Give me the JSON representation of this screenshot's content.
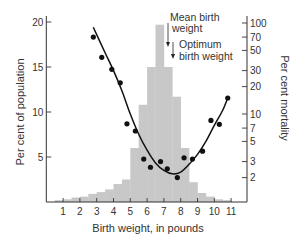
{
  "chart_data": {
    "type": "bar",
    "title": "",
    "xlabel": "Birth weight, in pounds",
    "ylabel": "Per cent of population",
    "ylabel_right": "Per cent mortality",
    "x_ticks": [
      1,
      2,
      3,
      4,
      5,
      6,
      7,
      8,
      9,
      10,
      11
    ],
    "y_ticks_left": [
      5,
      10,
      15,
      20
    ],
    "y_ticks_right": [
      2,
      3,
      5,
      7,
      10,
      20,
      30,
      50,
      70,
      100
    ],
    "ylim_left": [
      0,
      21
    ],
    "ylim_right_log": [
      1,
      100
    ],
    "histogram": {
      "name": "Per cent of population (birth weight distribution)",
      "bin_width_lb": 0.5,
      "bins": [
        {
          "from": 0.5,
          "to": 1.0,
          "value": 0.2
        },
        {
          "from": 1.0,
          "to": 1.5,
          "value": 0.3
        },
        {
          "from": 1.5,
          "to": 2.0,
          "value": 0.5
        },
        {
          "from": 2.0,
          "to": 2.5,
          "value": 0.6
        },
        {
          "from": 2.5,
          "to": 3.0,
          "value": 0.9
        },
        {
          "from": 3.0,
          "to": 3.5,
          "value": 1.1
        },
        {
          "from": 3.5,
          "to": 4.0,
          "value": 1.4
        },
        {
          "from": 4.0,
          "to": 4.5,
          "value": 2.0
        },
        {
          "from": 4.5,
          "to": 5.0,
          "value": 2.5
        },
        {
          "from": 5.0,
          "to": 5.5,
          "value": 6.0
        },
        {
          "from": 5.5,
          "to": 6.0,
          "value": 10.8
        },
        {
          "from": 6.0,
          "to": 6.5,
          "value": 15.0
        },
        {
          "from": 6.5,
          "to": 7.0,
          "value": 19.7
        },
        {
          "from": 7.0,
          "to": 7.5,
          "value": 15.0
        },
        {
          "from": 7.5,
          "to": 8.0,
          "value": 11.7
        },
        {
          "from": 8.0,
          "to": 8.5,
          "value": 6.0
        },
        {
          "from": 8.5,
          "to": 9.0,
          "value": 2.2
        },
        {
          "from": 9.0,
          "to": 9.5,
          "value": 1.0
        },
        {
          "from": 9.5,
          "to": 10.0,
          "value": 0.6
        },
        {
          "from": 10.0,
          "to": 10.5,
          "value": 0.3
        },
        {
          "from": 10.5,
          "to": 11.0,
          "value": 0.2
        }
      ],
      "color": "#c8c8c8"
    },
    "mortality_points": {
      "name": "Per cent mortality (observed)",
      "x": [
        2.8,
        3.3,
        3.9,
        4.4,
        4.8,
        5.3,
        5.8,
        6.2,
        6.8,
        7.2,
        7.8,
        8.2,
        8.7,
        9.3,
        9.8,
        10.3,
        10.8
      ],
      "y": [
        70,
        42,
        31,
        22,
        7.8,
        6.5,
        3.2,
        2.6,
        3.0,
        2.5,
        2.0,
        3.3,
        3.2,
        3.9,
        8.5,
        7.7,
        15
      ]
    },
    "mortality_curve": {
      "name": "Fitted mortality curve",
      "x": [
        2.8,
        3.5,
        4.0,
        4.5,
        5.0,
        5.5,
        6.0,
        6.5,
        7.0,
        7.5,
        8.0,
        8.5,
        9.0,
        9.5,
        10.0,
        10.5,
        10.8
      ],
      "y": [
        90,
        47,
        30,
        18,
        10,
        6.0,
        4.0,
        2.9,
        2.4,
        2.2,
        2.3,
        2.8,
        3.6,
        5.0,
        7.5,
        11,
        15
      ]
    },
    "annotations": [
      {
        "text": "Mean birth weight",
        "x": 6.9,
        "arrow": true
      },
      {
        "text": "Optimum birth weight",
        "x": 7.4,
        "arrow": true
      }
    ],
    "legend": "none",
    "grid": false
  },
  "labels": {
    "annotation_mean_line1": "Mean birth",
    "annotation_mean_line2": "weight",
    "annotation_opt_line1": "Optimum",
    "annotation_opt_line2": "birth weight"
  },
  "colors": {
    "histogram": "#c8c8c8",
    "axis": "#333333",
    "curve": "#111111",
    "points": "#111111"
  }
}
